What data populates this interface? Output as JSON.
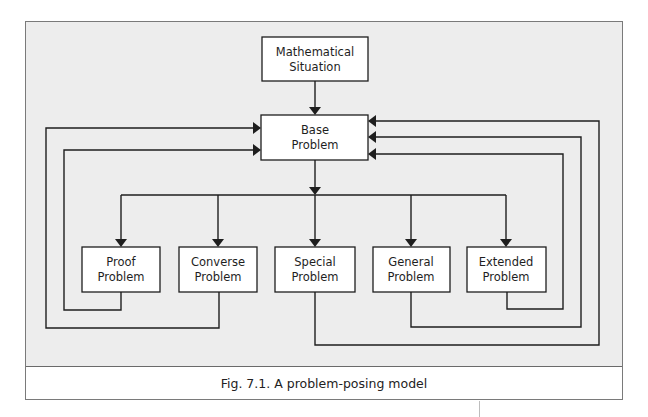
{
  "figure": {
    "caption": "Fig. 7.1. A problem-posing model"
  },
  "nodes": {
    "situation": {
      "line1": "Mathematical",
      "line2": "Situation"
    },
    "base": {
      "line1": "Base",
      "line2": "Problem"
    },
    "proof": {
      "line1": "Proof",
      "line2": "Problem"
    },
    "converse": {
      "line1": "Converse",
      "line2": "Problem"
    },
    "special": {
      "line1": "Special",
      "line2": "Problem"
    },
    "general": {
      "line1": "General",
      "line2": "Problem"
    },
    "extended": {
      "line1": "Extended",
      "line2": "Problem"
    }
  },
  "edges": [
    {
      "from": "Mathematical Situation",
      "to": "Base Problem"
    },
    {
      "from": "Base Problem",
      "to": "Proof Problem"
    },
    {
      "from": "Base Problem",
      "to": "Converse Problem"
    },
    {
      "from": "Base Problem",
      "to": "Special Problem"
    },
    {
      "from": "Base Problem",
      "to": "General Problem"
    },
    {
      "from": "Base Problem",
      "to": "Extended Problem"
    },
    {
      "from": "Proof Problem",
      "to": "Base Problem"
    },
    {
      "from": "Converse Problem",
      "to": "Base Problem"
    },
    {
      "from": "Special Problem",
      "to": "Base Problem"
    },
    {
      "from": "General Problem",
      "to": "Base Problem"
    },
    {
      "from": "Extended Problem",
      "to": "Base Problem"
    }
  ],
  "colors": {
    "background": "#ededed",
    "line": "#1e1e1e",
    "box_fill": "#ffffff",
    "frame": "#7a7a7a"
  }
}
